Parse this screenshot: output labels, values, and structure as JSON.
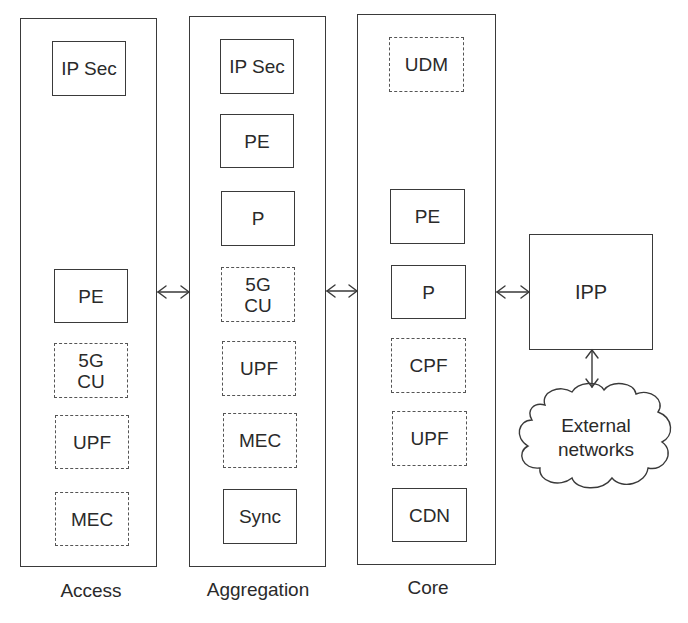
{
  "columns": [
    {
      "id": "access",
      "label": "Access",
      "nodes": [
        {
          "label": "IP Sec",
          "style": "solid"
        },
        {
          "label": "PE",
          "style": "solid"
        },
        {
          "label": "5G\nCU",
          "style": "dashed"
        },
        {
          "label": "UPF",
          "style": "dashed"
        },
        {
          "label": "MEC",
          "style": "dashed"
        }
      ]
    },
    {
      "id": "aggregation",
      "label": "Aggregation",
      "nodes": [
        {
          "label": "IP Sec",
          "style": "solid"
        },
        {
          "label": "PE",
          "style": "solid"
        },
        {
          "label": "P",
          "style": "solid"
        },
        {
          "label": "5G\nCU",
          "style": "dashed"
        },
        {
          "label": "UPF",
          "style": "dashed"
        },
        {
          "label": "MEC",
          "style": "dashed"
        },
        {
          "label": "Sync",
          "style": "solid"
        }
      ]
    },
    {
      "id": "core",
      "label": "Core",
      "nodes": [
        {
          "label": "UDM",
          "style": "dashed"
        },
        {
          "label": "PE",
          "style": "solid"
        },
        {
          "label": "P",
          "style": "solid"
        },
        {
          "label": "CPF",
          "style": "dashed"
        },
        {
          "label": "UPF",
          "style": "dashed"
        },
        {
          "label": "CDN",
          "style": "solid"
        }
      ]
    }
  ],
  "ipp": {
    "label": "IPP"
  },
  "cloud": {
    "line1": "External",
    "line2": "networks"
  },
  "links": [
    {
      "from": "access",
      "to": "aggregation",
      "type": "bidirectional"
    },
    {
      "from": "aggregation",
      "to": "core",
      "type": "bidirectional"
    },
    {
      "from": "core",
      "to": "ipp",
      "type": "bidirectional"
    },
    {
      "from": "ipp",
      "to": "external-networks",
      "type": "bidirectional"
    }
  ],
  "legend_hint": {
    "solid_border": "solid node",
    "dashed_border": "dashed node"
  }
}
